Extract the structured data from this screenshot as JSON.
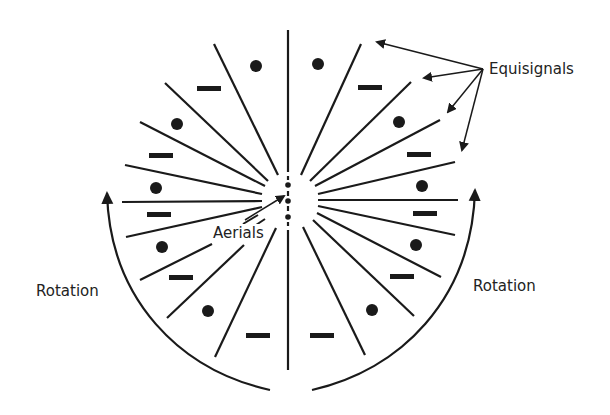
{
  "diagram": {
    "labels": {
      "equisignals": "Equisignals",
      "aerials": "Aerials",
      "rotation_left": "Rotation",
      "rotation_right": "Rotation"
    },
    "colors": {
      "ink": "#1a1a1a",
      "background": "#ffffff"
    },
    "center": {
      "x": 288,
      "y": 200
    },
    "aerial_dots": [
      {
        "x": 288,
        "y": 185
      },
      {
        "x": 288,
        "y": 201
      },
      {
        "x": 288,
        "y": 217
      }
    ],
    "sector_symbols": {
      "dot": "positive / dot signal",
      "dash": "negative / dash signal"
    }
  }
}
